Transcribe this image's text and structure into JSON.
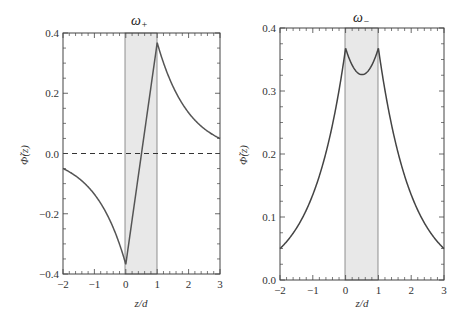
{
  "chart_data": [
    {
      "type": "line",
      "title": "ω₊",
      "xlabel": "z/d",
      "ylabel": "Φ̃(z)",
      "xlim": [
        -2,
        3
      ],
      "ylim": [
        -0.4,
        0.4
      ],
      "xticks": [
        "−2",
        "−1",
        "0",
        "1",
        "2",
        "3"
      ],
      "yticks": [
        "−0.4",
        "−0.2",
        "0.0",
        "0.2",
        "0.4"
      ],
      "shaded_region": [
        0,
        1
      ],
      "reference_line": {
        "y": 0.0,
        "style": "dashed"
      },
      "series": [
        {
          "name": "Φ̃(z)",
          "x": [
            -2,
            -1.5,
            -1,
            -0.5,
            0,
            0.5,
            1,
            1.5,
            2,
            2.5,
            3
          ],
          "y": [
            -0.05,
            -0.08,
            -0.135,
            -0.22,
            -0.368,
            0.0,
            0.368,
            0.223,
            0.135,
            0.082,
            0.05
          ]
        }
      ]
    },
    {
      "type": "line",
      "title": "ω₋",
      "xlabel": "z/d",
      "ylabel": "Φ̃(z)",
      "xlim": [
        -2,
        3
      ],
      "ylim": [
        0.0,
        0.4
      ],
      "xticks": [
        "−2",
        "−1",
        "0",
        "1",
        "2",
        "3"
      ],
      "yticks": [
        "0.0",
        "0.1",
        "0.2",
        "0.3",
        "0.4"
      ],
      "shaded_region": [
        0,
        1
      ],
      "series": [
        {
          "name": "Φ̃(z)",
          "x": [
            -2,
            -1.5,
            -1,
            -0.5,
            0,
            0.25,
            0.5,
            0.75,
            1,
            1.5,
            2,
            2.5,
            3
          ],
          "y": [
            0.05,
            0.082,
            0.135,
            0.223,
            0.368,
            0.338,
            0.326,
            0.338,
            0.368,
            0.223,
            0.135,
            0.082,
            0.05
          ]
        }
      ]
    }
  ],
  "labels": {
    "left_title": "ω",
    "left_sub": "+",
    "right_title": "ω",
    "right_sub": "−",
    "xlabel": "z/d",
    "ylabel": "Φ̃(z)"
  }
}
